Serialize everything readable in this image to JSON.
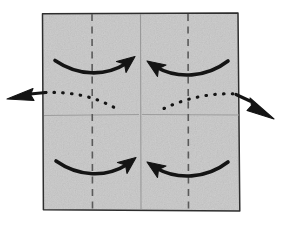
{
  "figure": {
    "description": "A square sheet of gray textured paper with vertical quarter crease lines shown dashed, center horizontal and vertical creases shown thin, four curved solid arrows pressing the left and right quarters toward the vertical center, and a dotted arc spanning the sheet with solid arrowheads pointing out to the left and out to the lower right.",
    "background_color": "#ffffff"
  },
  "paper": {
    "label": "paper-square",
    "fill_color": "#c2c2c2",
    "edge_color": "#2b2b2b",
    "corners": {
      "top_left": [
        42,
        13
      ],
      "top_right": [
        238,
        13
      ],
      "bottom_right": [
        240,
        211
      ],
      "bottom_left": [
        43,
        210
      ]
    }
  },
  "creases": {
    "dashed_color": "#4a4a4a",
    "solid_color": "#8c8c8c",
    "items": [
      {
        "name": "quarter-crease-left",
        "style": "dashed",
        "orientation": "vertical",
        "x": 92
      },
      {
        "name": "quarter-crease-right",
        "style": "dashed",
        "orientation": "vertical",
        "x": 188
      },
      {
        "name": "center-crease-vertical",
        "style": "solid-thin",
        "orientation": "vertical",
        "x": 140
      },
      {
        "name": "center-crease-horizontal",
        "style": "solid-thin",
        "orientation": "horizontal",
        "y": 115
      }
    ]
  },
  "arrows": {
    "stroke_color": "#111111",
    "items": [
      {
        "name": "fold-arrow-top-left",
        "direction": "right",
        "style": "solid-curved",
        "quadrant": "top-left"
      },
      {
        "name": "fold-arrow-top-right",
        "direction": "left",
        "style": "solid-curved",
        "quadrant": "top-right"
      },
      {
        "name": "fold-arrow-bottom-left",
        "direction": "right",
        "style": "solid-curved",
        "quadrant": "bottom-left"
      },
      {
        "name": "fold-arrow-bottom-right",
        "direction": "left",
        "style": "solid-curved",
        "quadrant": "bottom-right"
      },
      {
        "name": "pull-arrow-left",
        "direction": "out-left",
        "style": "dotted-path-with-solid-head"
      },
      {
        "name": "pull-arrow-right",
        "direction": "out-lower-right",
        "style": "dotted-path-with-solid-head"
      }
    ]
  }
}
